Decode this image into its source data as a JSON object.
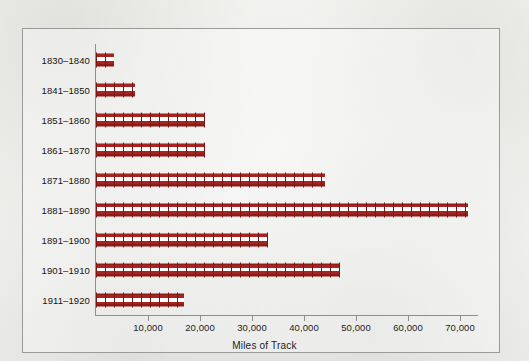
{
  "chart_data": {
    "type": "bar",
    "orientation": "horizontal",
    "title": "",
    "xlabel": "Miles of Track",
    "ylabel": "",
    "categories": [
      "1830–1840",
      "1841–1850",
      "1851–1860",
      "1861–1870",
      "1871–1880",
      "1881–1890",
      "1891–1900",
      "1901–1910",
      "1911–1920"
    ],
    "values": [
      3500,
      7500,
      21000,
      21000,
      44000,
      71500,
      33000,
      47000,
      17000
    ],
    "xlim": [
      0,
      73500
    ],
    "xticks": [
      10000,
      20000,
      30000,
      40000,
      50000,
      60000,
      70000
    ],
    "xtick_labels": [
      "10,000",
      "20,000",
      "30,000",
      "40,000",
      "50,000",
      "60,000",
      "70,000"
    ],
    "grid": false,
    "legend": null,
    "bar_style": "railroad-track",
    "colors": {
      "bar_rail": "#a52420",
      "bar_rail_dark": "#8e1b17",
      "bar_tie": "#7d1512",
      "axis": "#8e8e8e",
      "frame": "#9a9a9a",
      "text": "#141414",
      "background": "#f4f4f2"
    }
  }
}
